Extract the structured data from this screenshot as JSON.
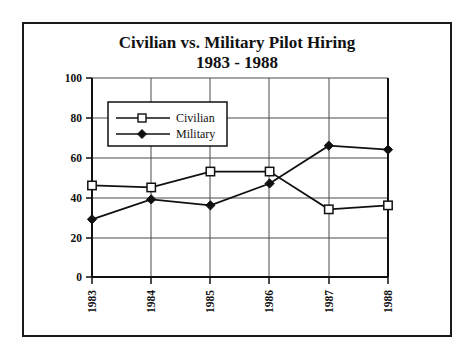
{
  "chart_data": {
    "type": "line",
    "title": "Civilian vs. Military Pilot Hiring",
    "subtitle": "1983 - 1988",
    "xlabel": "",
    "ylabel": "",
    "categories": [
      "1983",
      "1984",
      "1985",
      "1986",
      "1987",
      "1988"
    ],
    "series": [
      {
        "name": "Civilian",
        "marker": "open-square",
        "values": [
          46,
          45,
          53,
          53,
          34,
          36
        ]
      },
      {
        "name": "Military",
        "marker": "filled-diamond",
        "values": [
          29,
          39,
          36,
          47,
          66,
          64
        ]
      }
    ],
    "ylim": [
      0,
      100
    ],
    "yticks": [
      0,
      20,
      40,
      60,
      80,
      100
    ],
    "ytick_labels": [
      "0",
      "20",
      "40",
      "60",
      "80",
      "100"
    ],
    "grid": true,
    "legend_position": "upper-left-inside",
    "colors": {
      "line": "#111111",
      "grid": "#4a4a4a",
      "axis": "#111111",
      "background": "#ffffff"
    }
  },
  "legend": {
    "items": [
      {
        "label": "Civilian",
        "marker": "open-square-marker"
      },
      {
        "label": "Military",
        "marker": "filled-diamond-marker"
      }
    ]
  },
  "axis": {
    "y_labels": [
      "100",
      "80",
      "60",
      "40",
      "20",
      "0"
    ],
    "x_labels": [
      "1983",
      "1984",
      "1985",
      "1986",
      "1987",
      "1988"
    ]
  }
}
